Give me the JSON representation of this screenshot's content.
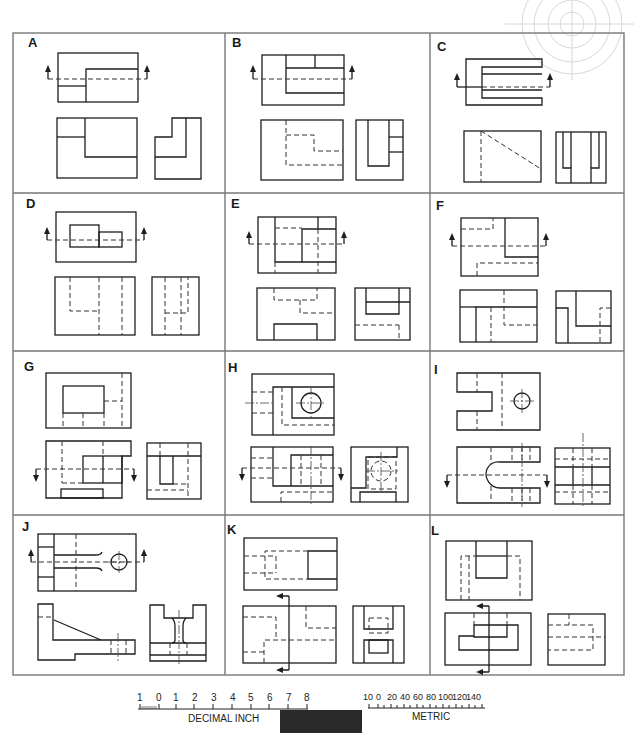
{
  "sheet": {
    "description": "Orthographic projection exercise sheet: twelve problems labeled A through L, each with a top view and front/side views; cutting-plane lines with arrows indicate sections.",
    "panels": [
      {
        "label": "A"
      },
      {
        "label": "B"
      },
      {
        "label": "C"
      },
      {
        "label": "D"
      },
      {
        "label": "E"
      },
      {
        "label": "F"
      },
      {
        "label": "G"
      },
      {
        "label": "H"
      },
      {
        "label": "I"
      },
      {
        "label": "J"
      },
      {
        "label": "K"
      },
      {
        "label": "L"
      }
    ]
  },
  "scales": {
    "inch": {
      "ticks": [
        "1",
        "0",
        "1",
        "2",
        "3",
        "4",
        "5",
        "6",
        "7",
        "8"
      ],
      "label": "DECIMAL INCH"
    },
    "metric": {
      "ticks": [
        "10",
        "0",
        "20",
        "40",
        "60",
        "80",
        "100",
        "120",
        "140"
      ],
      "label": "METRIC"
    }
  },
  "colors": {
    "line": "#1e1e1e",
    "grid": "#777777",
    "watermark": "#d8d8d8",
    "footer_bar": "#2a2a2a"
  }
}
